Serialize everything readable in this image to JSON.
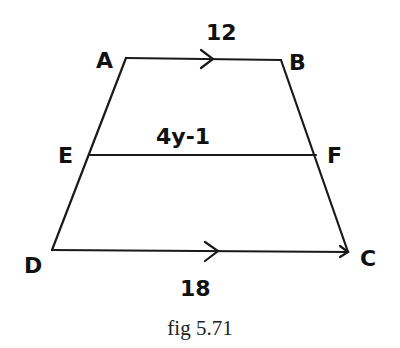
{
  "figure": {
    "caption": "fig 5.71",
    "shape": "trapezoid",
    "vertices": {
      "A": {
        "label": "A",
        "x": 126,
        "y": 58
      },
      "B": {
        "label": "B",
        "x": 281,
        "y": 60
      },
      "C": {
        "label": "C",
        "x": 348,
        "y": 252
      },
      "D": {
        "label": "D",
        "x": 52,
        "y": 250
      },
      "E": {
        "label": "E",
        "x": 90,
        "y": 155
      },
      "F": {
        "label": "F",
        "x": 316,
        "y": 155
      }
    },
    "segments": {
      "AB": {
        "length_label": "12",
        "parallel_arrow": true
      },
      "EF": {
        "length_label": "4y-1",
        "parallel_arrow": false
      },
      "DC": {
        "length_label": "18",
        "parallel_arrow": true
      }
    },
    "colors": {
      "ink": "#1a1a1a",
      "background": "#ffffff"
    }
  }
}
